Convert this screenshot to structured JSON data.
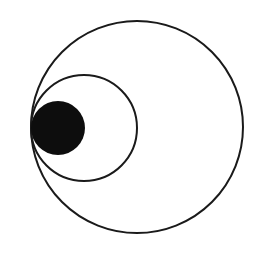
{
  "diagram": {
    "type": "nested-tangent-circles",
    "background": "#ffffff",
    "stroke_color": "#1a1a1a",
    "fill_color": "#0d0d0d",
    "tangent_point": {
      "x": 31,
      "y": 128
    },
    "circles": [
      {
        "name": "outer-circle",
        "cx": 137,
        "cy": 127,
        "r": 106,
        "filled": false
      },
      {
        "name": "middle-circle",
        "cx": 84,
        "cy": 128,
        "r": 53,
        "filled": false
      },
      {
        "name": "inner-filled-circle",
        "cx": 58,
        "cy": 128,
        "r": 27,
        "filled": true
      }
    ]
  }
}
